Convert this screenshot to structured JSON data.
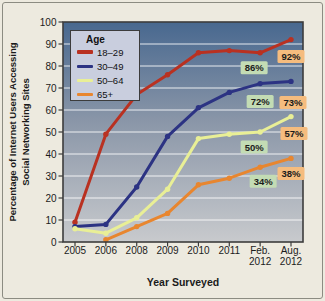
{
  "figure": {
    "background_color": "#edeadf",
    "border_color": "#8c8c82"
  },
  "chart_data": {
    "type": "line",
    "title": "",
    "xlabel": "Year Surveyed",
    "ylabel": "Percentage of Internet Users Accessing Social Networking Sites",
    "ylabel_lines": [
      "Percentage of Internet Users Accessing",
      "Social Networking Sites"
    ],
    "ylim": [
      0,
      100
    ],
    "ytick_step": 10,
    "grid": true,
    "gridline_color": "#ffffff",
    "axis_color": "#3c3c3c",
    "text_color": "#1b1b1b",
    "plot_gradient": [
      "#48688f",
      "#8a96a8",
      "#c8cacd"
    ],
    "legend_title": "Age",
    "legend_position": "top-left",
    "legend_background": "#c9cede",
    "categories": [
      [
        "2005"
      ],
      [
        "2006"
      ],
      [
        "2008"
      ],
      [
        "2009"
      ],
      [
        "2010"
      ],
      [
        "2011"
      ],
      [
        "Feb.",
        "2012"
      ],
      [
        "Aug.",
        "2012"
      ]
    ],
    "series": [
      {
        "name": "18–29",
        "color": "#b93121",
        "values": [
          9,
          49,
          67,
          76,
          86,
          87,
          86,
          92
        ]
      },
      {
        "name": "30–49",
        "color": "#2c3383",
        "values": [
          7,
          8,
          25,
          48,
          61,
          68,
          72,
          73
        ]
      },
      {
        "name": "50–64",
        "color": "#e9ef96",
        "values": [
          6,
          4,
          11,
          24,
          47,
          49,
          50,
          57
        ]
      },
      {
        "name": "65+",
        "color": "#e8862f",
        "values": [
          null,
          1,
          7,
          13,
          26,
          29,
          34,
          38
        ]
      }
    ],
    "annotations": [
      {
        "text": "92%",
        "bg": "#f5bc7e",
        "x_index": 7,
        "value": 92,
        "dx": 0,
        "dy": 17
      },
      {
        "text": "86%",
        "bg": "#c3dcb4",
        "x_index": 6,
        "value": 86,
        "dx": -6,
        "dy": 15
      },
      {
        "text": "73%",
        "bg": "#f5bc7e",
        "x_index": 7,
        "value": 73,
        "dx": 2,
        "dy": 21
      },
      {
        "text": "72%",
        "bg": "#c3dcb4",
        "x_index": 6,
        "value": 72,
        "dx": 0,
        "dy": 18
      },
      {
        "text": "57%",
        "bg": "#f5bc7e",
        "x_index": 7,
        "value": 57,
        "dx": 3,
        "dy": 17
      },
      {
        "text": "50%",
        "bg": "#c3dcb4",
        "x_index": 6,
        "value": 50,
        "dx": -6,
        "dy": 15
      },
      {
        "text": "38%",
        "bg": "#f5bc7e",
        "x_index": 7,
        "value": 38,
        "dx": 0,
        "dy": 15
      },
      {
        "text": "34%",
        "bg": "#c3dcb4",
        "x_index": 6,
        "value": 34,
        "dx": 3,
        "dy": 14
      }
    ]
  }
}
